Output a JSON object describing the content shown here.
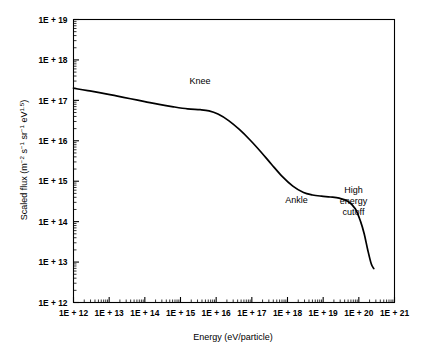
{
  "chart_data": {
    "type": "line",
    "title": "",
    "xlabel": "Energy (eV/particle)",
    "ylabel": "Scaled flux (m-2 s-1 sr-1 eV1.5)",
    "ylabel_parts": {
      "prefix": "Scaled flux (m",
      "sup1": "−2",
      "mid1": " s",
      "sup2": "−1",
      "mid2": " sr",
      "sup3": "−1",
      "mid3": " eV",
      "sup4": "1.5",
      "suffix": ")"
    },
    "xlim": [
      12,
      21
    ],
    "ylim": [
      12,
      19
    ],
    "xscale": "log",
    "yscale": "log",
    "grid": false,
    "legend": false,
    "x_tick_labels": [
      "1E + 12",
      "1E + 13",
      "1E + 14",
      "1E + 15",
      "1E + 16",
      "1E + 17",
      "1E + 18",
      "1E + 19",
      "1E + 20",
      "1E + 21"
    ],
    "y_tick_labels": [
      "1E + 12",
      "1E + 13",
      "1E + 14",
      "1E + 15",
      "1E + 16",
      "1E + 17",
      "1E + 18",
      "1E + 19"
    ],
    "x_log_values": [
      12,
      13,
      14,
      15,
      16,
      17,
      18,
      19,
      20,
      21
    ],
    "y_log_values": [
      12,
      13,
      14,
      15,
      16,
      17,
      18,
      19
    ],
    "series": [
      {
        "name": "cosmic-ray-spectrum",
        "x_log": [
          12.0,
          12.4,
          12.8,
          13.2,
          13.6,
          14.0,
          14.4,
          14.8,
          15.2,
          15.55,
          15.8,
          16.05,
          16.35,
          16.65,
          16.95,
          17.25,
          17.55,
          17.85,
          18.15,
          18.45,
          18.7,
          18.95,
          19.2,
          19.45,
          19.7,
          19.9,
          20.05,
          20.15,
          20.25,
          20.35,
          20.42
        ],
        "y_log": [
          17.3,
          17.24,
          17.18,
          17.11,
          17.04,
          16.97,
          16.9,
          16.84,
          16.79,
          16.77,
          16.74,
          16.66,
          16.5,
          16.28,
          16.02,
          15.73,
          15.42,
          15.12,
          14.88,
          14.72,
          14.66,
          14.63,
          14.61,
          14.58,
          14.5,
          14.32,
          14.0,
          13.7,
          13.3,
          12.95,
          12.84
        ]
      }
    ],
    "annotations": [
      {
        "text": "Knee",
        "x_log": 15.55,
        "y_log": 17.4,
        "lines": [
          "Knee"
        ]
      },
      {
        "text": "Ankle",
        "x_log": 18.25,
        "y_log": 14.45,
        "lines": [
          "Ankle"
        ]
      },
      {
        "text": "High energy cutoff",
        "x_log": 19.85,
        "y_log": 14.72,
        "lines": [
          "High",
          "energy",
          "cutoff"
        ]
      }
    ],
    "colors": {
      "curve": "#000000",
      "axis": "#000000",
      "background": "#ffffff",
      "text": "#000000"
    }
  }
}
